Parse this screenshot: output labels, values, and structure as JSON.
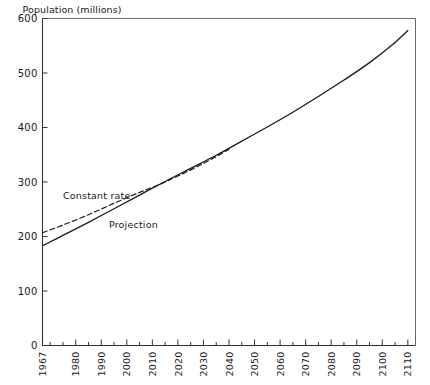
{
  "chart_data": {
    "type": "line",
    "title": "",
    "subtitle": "",
    "xlabel": "",
    "ylabel": "Population (millions)",
    "xlim": [
      1967,
      2113
    ],
    "ylim": [
      0,
      600
    ],
    "grid": false,
    "legend_position": "inline-annotations",
    "y_ticks": [
      0,
      100,
      200,
      300,
      400,
      500,
      600
    ],
    "y_tick_labels": [
      "0",
      "100",
      "200",
      "300",
      "400",
      "500",
      "600"
    ],
    "x_ticks": [
      1967,
      1980,
      1990,
      2000,
      2010,
      2020,
      2030,
      2040,
      2050,
      2060,
      2070,
      2080,
      2090,
      2100,
      2110
    ],
    "x_tick_labels": [
      "1967",
      "1980",
      "1990",
      "2000",
      "2010",
      "2020",
      "2030",
      "2040",
      "2050",
      "2060",
      "2070",
      "2080",
      "2090",
      "2100",
      "2110"
    ],
    "x_minor_tick_interval": 5,
    "x_tick_label_rotation": -90,
    "annotations": [
      {
        "text": "Constant rate",
        "x": 1975,
        "y": 268
      },
      {
        "text": "Projection",
        "x": 1993,
        "y": 216
      }
    ],
    "series": [
      {
        "name": "Projection",
        "style": "solid",
        "color": "#1a1a1a",
        "x": [
          1967,
          1975,
          1985,
          1995,
          2005,
          2015,
          2025,
          2035,
          2045,
          2055,
          2065,
          2075,
          2085,
          2095,
          2105,
          2110
        ],
        "values": [
          183,
          202,
          226,
          251,
          276,
          301,
          325,
          349,
          375,
          401,
          428,
          457,
          487,
          519,
          556,
          578
        ]
      },
      {
        "name": "Constant rate",
        "style": "dashed",
        "color": "#1a1a1a",
        "x": [
          1967,
          1975,
          1985,
          1995,
          2005,
          2012,
          2020,
          2030,
          2040
        ],
        "values": [
          207,
          221,
          240,
          261,
          281,
          294,
          311,
          334,
          360
        ]
      }
    ]
  },
  "axis": {
    "y_title": "Population (millions)"
  }
}
